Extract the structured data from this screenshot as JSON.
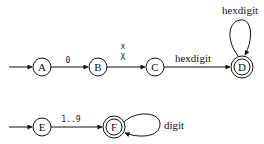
{
  "diagram": {
    "type": "finite-state-automaton",
    "automata": [
      {
        "name": "hex-literal",
        "start": "A",
        "states": [
          {
            "id": "A",
            "label": "A",
            "accepting": false
          },
          {
            "id": "B",
            "label": "B",
            "accepting": false
          },
          {
            "id": "C",
            "label": "C",
            "accepting": false
          },
          {
            "id": "D",
            "label": "D",
            "accepting": true
          }
        ],
        "transitions": [
          {
            "from": "A",
            "to": "B",
            "label": "0"
          },
          {
            "from": "B",
            "to": "C",
            "label_lines": [
              "x",
              "X"
            ]
          },
          {
            "from": "C",
            "to": "D",
            "label": "hexdigit"
          },
          {
            "from": "D",
            "to": "D",
            "label": "hexdigit"
          }
        ]
      },
      {
        "name": "decimal-literal",
        "start": "E",
        "states": [
          {
            "id": "E",
            "label": "E",
            "accepting": false
          },
          {
            "id": "F",
            "label": "F",
            "accepting": true
          }
        ],
        "transitions": [
          {
            "from": "E",
            "to": "F",
            "label": "1..9"
          },
          {
            "from": "F",
            "to": "F",
            "label": "digit"
          }
        ]
      }
    ]
  }
}
